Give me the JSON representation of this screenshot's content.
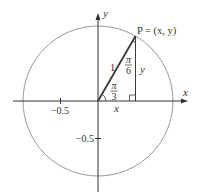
{
  "diagram": {
    "type": "unit-circle",
    "colors": {
      "circle": "#9a9a9a",
      "axes": "#333333",
      "triangle": "#3a3a3a",
      "text": "#333333",
      "background": "#ffffff"
    },
    "labels": {
      "x_axis": "x",
      "y_axis": "y",
      "point": "P = (x, y)",
      "hypotenuse": "1",
      "top_angle_num": "π",
      "top_angle_den": "6",
      "bottom_angle_num": "π",
      "bottom_angle_den": "3",
      "vertical_leg": "y",
      "horizontal_leg": "x",
      "tick_x_neg": "−0.5",
      "tick_y_neg": "−0.5"
    }
  }
}
